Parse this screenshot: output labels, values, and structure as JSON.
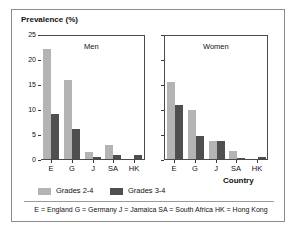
{
  "chart_data": {
    "type": "bar",
    "title": "",
    "ylabel": "Prevalence (%)",
    "xlabel": "Country",
    "ylim": [
      0,
      25
    ],
    "yticks": [
      0,
      5,
      10,
      15,
      20,
      25
    ],
    "ytick_labels": [
      "0",
      "5",
      "10",
      "15",
      "20",
      "25"
    ],
    "grid": false,
    "legend_position": "bottom-left",
    "categories": [
      "E",
      "G",
      "J",
      "SA",
      "HK"
    ],
    "panels": [
      {
        "name": "Men",
        "series": [
          {
            "name": "Grades 2-4",
            "values": [
              22.1,
              15.9,
              1.4,
              2.8,
              0.0
            ]
          },
          {
            "name": "Grades 3-4",
            "values": [
              9.1,
              6.1,
              0.4,
              0.8,
              0.9
            ]
          }
        ]
      },
      {
        "name": "Women",
        "series": [
          {
            "name": "Grades 2-4",
            "values": [
              15.6,
              9.8,
              3.6,
              1.7,
              0.0
            ]
          },
          {
            "name": "Grades 3-4",
            "values": [
              10.8,
              4.7,
              3.6,
              0.2,
              0.5
            ]
          }
        ]
      }
    ],
    "legend": [
      {
        "label": "Grades 2-4",
        "color": "#b4b4b4"
      },
      {
        "label": "Grades 3-4",
        "color": "#4f4f4f"
      }
    ],
    "annotations": [
      "E = England   G = Germany   J = Jamaica   SA = South Africa   HK = Hong Kong"
    ]
  },
  "footnote": "E = England   G = Germany   J = Jamaica   SA = South Africa   HK = Hong Kong",
  "panel_titles": {
    "left": "Men",
    "right": "Women"
  }
}
